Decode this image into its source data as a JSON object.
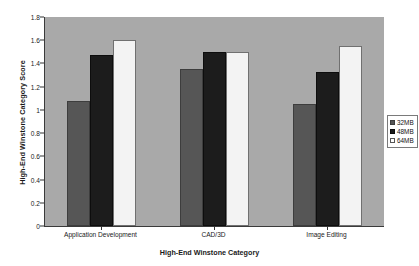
{
  "chart_data": {
    "type": "bar",
    "title": "",
    "xlabel": "High-End Winstone Category",
    "ylabel": "High-End Winstone Category Score",
    "categories": [
      "Application Development",
      "CAD/3D",
      "Image Editing"
    ],
    "series": [
      {
        "name": "32MB",
        "color": "#565656",
        "values": [
          1.08,
          1.35,
          1.05
        ]
      },
      {
        "name": "48MB",
        "color": "#1c1c1c",
        "values": [
          1.47,
          1.5,
          1.33
        ]
      },
      {
        "name": "64MB",
        "color": "#f3f3f3",
        "values": [
          1.6,
          1.5,
          1.55
        ]
      }
    ],
    "ylim": [
      0,
      1.8
    ],
    "ytick_step": 0.2,
    "ytick_labels": [
      "0",
      "0.2",
      "0.4",
      "0.6",
      "0.8",
      "1",
      "1.2",
      "1.4",
      "1.6",
      "1.8"
    ],
    "ytick_values": [
      0,
      0.2,
      0.4,
      0.6,
      0.8,
      1.0,
      1.2,
      1.4,
      1.6,
      1.8
    ],
    "grid": false,
    "legend_position": "right",
    "plot_background": "#a9a9a9",
    "figure_background": "#ffffff"
  }
}
